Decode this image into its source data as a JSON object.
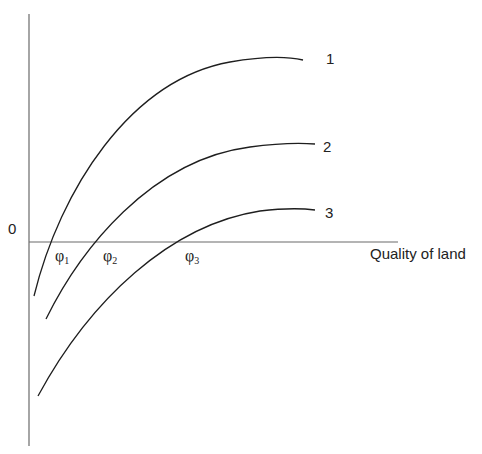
{
  "diagram": {
    "origin_label": "0",
    "x_axis_label": "Quality of land",
    "curves": [
      {
        "id": "1",
        "label": "1",
        "path": "M 34 296 C 60 190, 130 80, 230 62 C 265 56, 290 57, 303 60"
      },
      {
        "id": "2",
        "label": "2",
        "path": "M 46 319 C 80 250, 150 160, 250 147 C 280 143, 300 143, 315 144"
      },
      {
        "id": "3",
        "label": "3",
        "path": "M 38 396 C 90 300, 170 225, 260 211 C 285 208, 300 208, 315 210"
      }
    ],
    "intercepts": [
      {
        "symbol": "φ",
        "sub": "1"
      },
      {
        "symbol": "φ",
        "sub": "2"
      },
      {
        "symbol": "φ",
        "sub": "3"
      }
    ]
  }
}
